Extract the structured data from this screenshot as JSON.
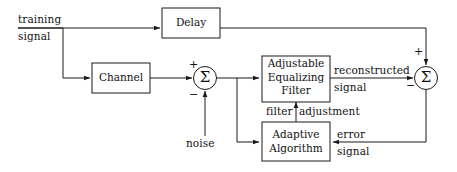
{
  "diagram": {
    "canvas": {
      "width": 457,
      "height": 172,
      "background": "#ffffff",
      "ink": "#1a1a1a"
    },
    "blocks": [
      {
        "id": "delay",
        "label": "Delay",
        "shape": "rect"
      },
      {
        "id": "channel",
        "label": "Channel",
        "shape": "rect"
      },
      {
        "id": "equalizer",
        "label_line1": "Adjustable",
        "label_line2": "Equalizing",
        "label_line3": "Filter",
        "shape": "rect"
      },
      {
        "id": "adaptive",
        "label_line1": "Adaptive",
        "label_line2": "Algorithm",
        "shape": "rect"
      },
      {
        "id": "summer_left",
        "label": "Σ",
        "shape": "circle"
      },
      {
        "id": "summer_right",
        "label": "Σ",
        "shape": "circle"
      }
    ],
    "signal_labels": {
      "training_line1": "training",
      "training_line2": "signal",
      "noise": "noise",
      "filter_adjustment_part1": "filter",
      "filter_adjustment_part2": "adjustment",
      "reconstructed_line1": "reconstructed",
      "reconstructed_line2": "signal",
      "error_line1": "error",
      "error_line2": "signal"
    },
    "signs": {
      "summer_left_plus": "+",
      "summer_left_minus": "−",
      "summer_right_plus": "+",
      "summer_right_minus": "−"
    }
  }
}
